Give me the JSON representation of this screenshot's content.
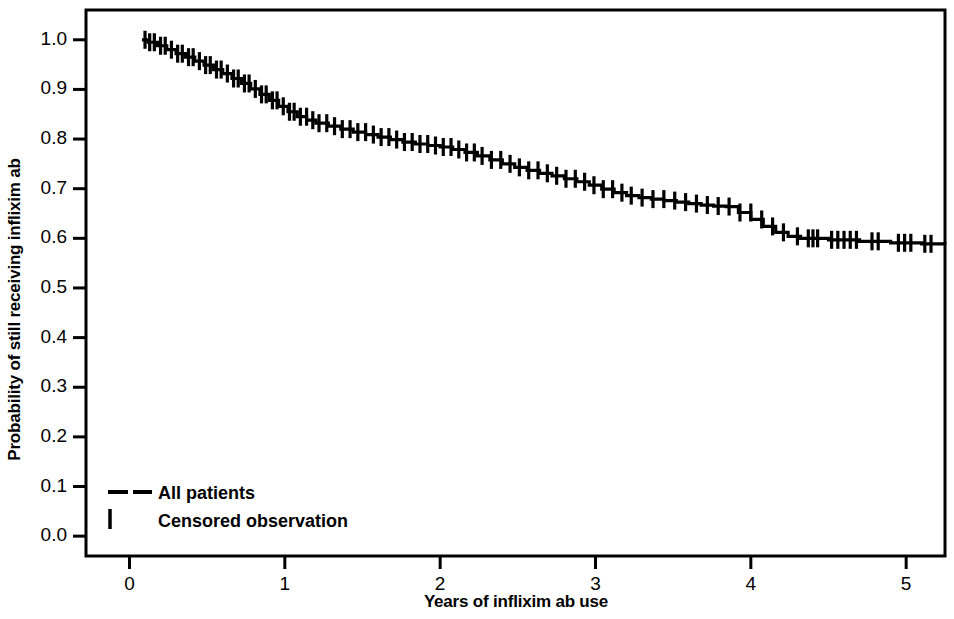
{
  "chart_data": {
    "type": "line",
    "title": "",
    "subtitle": "",
    "xlabel": "Years of inflixim ab use",
    "ylabel": "Probability of still receiving inflixim ab",
    "xlim": [
      -0.28,
      5.25
    ],
    "ylim": [
      -0.04,
      1.06
    ],
    "xticks": [
      0,
      1,
      2,
      3,
      4,
      5
    ],
    "xtick_labels": [
      "0",
      "1",
      "2",
      "3",
      "4",
      "5"
    ],
    "yticks": [
      0.0,
      0.1,
      0.2,
      0.3,
      0.4,
      0.5,
      0.6,
      0.7,
      0.8,
      0.9,
      1.0
    ],
    "ytick_labels": [
      "0.0",
      "0.1",
      "0.2",
      "0.3",
      "0.4",
      "0.5",
      "0.6",
      "0.7",
      "0.8",
      "0.9",
      "1.0"
    ],
    "grid": false,
    "legend_position": "lower left",
    "legend": [
      {
        "label": "All patients",
        "marker": "dashed-line"
      },
      {
        "label": "Censored observation",
        "marker": "vertical-tick"
      }
    ],
    "series": [
      {
        "name": "All patients",
        "kind": "kaplan-meier-survival",
        "x": [
          0.08,
          0.12,
          0.18,
          0.24,
          0.3,
          0.36,
          0.42,
          0.48,
          0.54,
          0.6,
          0.66,
          0.72,
          0.78,
          0.84,
          0.9,
          0.96,
          1.02,
          1.08,
          1.14,
          1.2,
          1.28,
          1.36,
          1.44,
          1.52,
          1.6,
          1.68,
          1.76,
          1.84,
          1.92,
          2.0,
          2.08,
          2.16,
          2.24,
          2.32,
          2.4,
          2.48,
          2.56,
          2.64,
          2.72,
          2.8,
          2.88,
          2.96,
          3.04,
          3.12,
          3.2,
          3.28,
          3.36,
          3.44,
          3.52,
          3.6,
          3.68,
          3.76,
          3.84,
          3.92,
          4.0,
          4.08,
          4.16,
          4.24,
          4.32,
          4.5,
          4.7,
          4.9,
          5.1,
          5.25
        ],
        "y": [
          1.0,
          0.995,
          0.988,
          0.98,
          0.972,
          0.965,
          0.957,
          0.949,
          0.94,
          0.932,
          0.922,
          0.912,
          0.901,
          0.89,
          0.878,
          0.866,
          0.855,
          0.845,
          0.838,
          0.832,
          0.826,
          0.82,
          0.814,
          0.809,
          0.804,
          0.799,
          0.794,
          0.79,
          0.787,
          0.784,
          0.779,
          0.773,
          0.766,
          0.758,
          0.75,
          0.743,
          0.737,
          0.731,
          0.726,
          0.72,
          0.714,
          0.707,
          0.699,
          0.692,
          0.686,
          0.682,
          0.679,
          0.676,
          0.673,
          0.67,
          0.667,
          0.665,
          0.664,
          0.652,
          0.638,
          0.624,
          0.612,
          0.604,
          0.6,
          0.597,
          0.594,
          0.591,
          0.589,
          0.588
        ]
      }
    ],
    "censor_marks_x": [
      0.1,
      0.13,
      0.16,
      0.2,
      0.23,
      0.27,
      0.31,
      0.34,
      0.38,
      0.41,
      0.45,
      0.49,
      0.52,
      0.56,
      0.59,
      0.63,
      0.67,
      0.7,
      0.74,
      0.77,
      0.81,
      0.85,
      0.88,
      0.92,
      0.95,
      0.99,
      1.03,
      1.06,
      1.1,
      1.14,
      1.18,
      1.22,
      1.27,
      1.32,
      1.37,
      1.42,
      1.47,
      1.52,
      1.57,
      1.62,
      1.67,
      1.72,
      1.77,
      1.82,
      1.87,
      1.92,
      1.97,
      2.02,
      2.07,
      2.12,
      2.17,
      2.22,
      2.27,
      2.33,
      2.39,
      2.45,
      2.51,
      2.57,
      2.63,
      2.69,
      2.75,
      2.81,
      2.87,
      2.93,
      2.99,
      3.05,
      3.11,
      3.17,
      3.23,
      3.3,
      3.37,
      3.44,
      3.51,
      3.58,
      3.65,
      3.72,
      3.79,
      3.86,
      3.93,
      4.0,
      4.07,
      4.14,
      4.21,
      4.3,
      4.37,
      4.4,
      4.43,
      4.52,
      4.56,
      4.6,
      4.64,
      4.68,
      4.78,
      4.82,
      4.95,
      4.99,
      5.03,
      5.12,
      5.16
    ],
    "censor_marker": "vertical-tick",
    "line_color": "#000000",
    "background_color": "#ffffff",
    "frame_color": "#000000"
  },
  "axis": {
    "x_title": "Years of inflixim ab use",
    "y_title": "Probability of still receiving inflixim ab"
  },
  "legend": {
    "all_patients": "All patients",
    "censored": "Censored observation"
  }
}
